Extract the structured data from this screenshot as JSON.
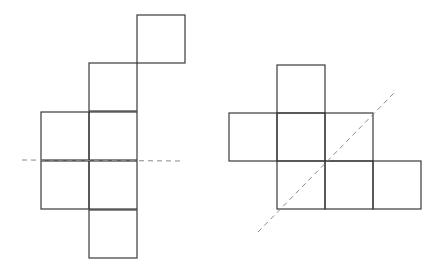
{
  "diagram": {
    "type": "geometry-nets-with-symmetry-axes",
    "background": "#ffffff",
    "stroke_color": "#3a3a3a",
    "axis_color": "#8a8a8a",
    "square_size": 48,
    "figures": [
      {
        "name": "left-figure",
        "squares": [
          {
            "x": 137,
            "y": 15
          },
          {
            "x": 89,
            "y": 63
          },
          {
            "x": 41,
            "y": 112
          },
          {
            "x": 89,
            "y": 112
          },
          {
            "x": 41,
            "y": 161
          },
          {
            "x": 89,
            "y": 161
          },
          {
            "x": 89,
            "y": 210
          }
        ],
        "axis": {
          "style": "dashed",
          "orientation": "horizontal",
          "x1": 22,
          "y1": 160,
          "x2": 184,
          "y2": 161
        }
      },
      {
        "name": "right-figure",
        "squares": [
          {
            "x": 277,
            "y": 65
          },
          {
            "x": 229,
            "y": 113
          },
          {
            "x": 277,
            "y": 113
          },
          {
            "x": 325,
            "y": 113
          },
          {
            "x": 277,
            "y": 161
          },
          {
            "x": 325,
            "y": 161
          },
          {
            "x": 373,
            "y": 161
          }
        ],
        "axis": {
          "style": "dashed",
          "orientation": "diagonal",
          "x1": 258,
          "y1": 232,
          "x2": 394,
          "y2": 93
        }
      }
    ]
  }
}
